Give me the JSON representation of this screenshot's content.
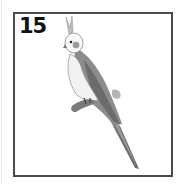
{
  "card": {
    "number": "15",
    "illustration": "cockatiel-perched-on-branch",
    "border_color": "#4a4a4a"
  }
}
